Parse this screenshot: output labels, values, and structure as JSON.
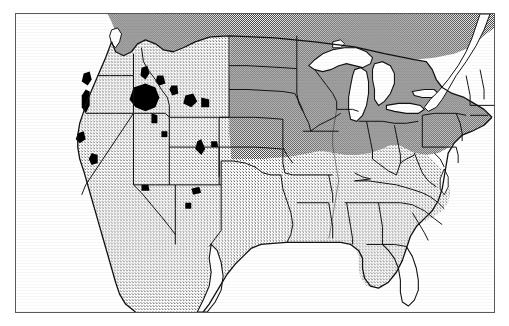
{
  "figure": {
    "kind": "scanned-map-figure",
    "width": 509,
    "height": 326,
    "background_color": "#ffffff"
  },
  "frame": {
    "name": "map-border",
    "x": 15,
    "y": 13,
    "width": 480,
    "height": 300,
    "stroke_color": "#555a5e",
    "stroke_width": 1,
    "fill_color": "#ffffff"
  },
  "palette": {
    "ink": "#000000",
    "outline": "#111111",
    "shade_dark": "#a0a0a0",
    "shade_light": "#d6d6d6",
    "water_white": "#ffffff",
    "lake_black": "#000000",
    "frame_gray": "#555a5e",
    "page_white": "#ffffff"
  },
  "legend_note": "No printed legend, caption, axis labels or text of any kind appears inside the image.",
  "regions": [
    {
      "name": "canada-strip",
      "label": "Canada (north of border)",
      "shading": "dark",
      "shade_color": "#a0a0a0"
    },
    {
      "name": "northeast-midwest-shaded",
      "label": "Northeast and Upper Midwest shaded group",
      "shading": "dark",
      "shade_color": "#a0a0a0",
      "members": [
        "North Dakota",
        "South Dakota",
        "Minnesota",
        "Wisconsin",
        "Michigan",
        "Iowa",
        "Illinois",
        "Indiana",
        "Ohio",
        "Pennsylvania",
        "New York",
        "New Jersey",
        "Connecticut",
        "Rhode Island",
        "Massachusetts",
        "Vermont",
        "New Hampshire",
        "Maine"
      ]
    },
    {
      "name": "west-south-shaded",
      "label": "West, Plains and South shaded group",
      "shading": "light",
      "shade_color": "#d6d6d6",
      "members": [
        "Washington",
        "Oregon",
        "California",
        "Nevada",
        "Idaho",
        "Montana",
        "Wyoming",
        "Utah",
        "Arizona",
        "Colorado",
        "New Mexico",
        "Texas",
        "Oklahoma",
        "Kansas",
        "Nebraska",
        "Missouri",
        "Arkansas",
        "Louisiana",
        "Mississippi",
        "Alabama",
        "Tennessee",
        "Kentucky",
        "West Virginia",
        "Virginia",
        "Maryland",
        "Delaware",
        "North Carolina",
        "South Carolina",
        "Georgia",
        "Florida"
      ]
    },
    {
      "name": "water-bodies",
      "label": "Great Lakes, oceans and gulfs",
      "shading": "white",
      "shade_color": "#ffffff",
      "members": [
        "Lake Superior",
        "Lake Michigan",
        "Lake Huron",
        "Lake Erie",
        "Lake Ontario",
        "Atlantic Ocean",
        "Gulf of Mexico",
        "Pacific Ocean",
        "Gulf of California",
        "Chesapeake Bay",
        "Puget Sound"
      ]
    },
    {
      "name": "inland-lakes",
      "label": "Solid black inland lakes and reservoirs of the West",
      "shading": "black",
      "shade_color": "#000000",
      "count": 14
    }
  ]
}
